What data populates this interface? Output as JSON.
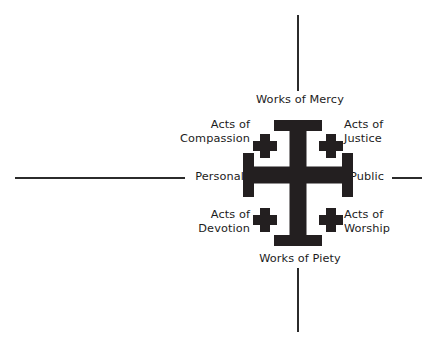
{
  "diagram": {
    "symbol": {
      "name": "jerusalem-cross",
      "color": "#231f20"
    },
    "axes": {
      "horizontal": {
        "left_label": "Personal",
        "right_label": "Public"
      },
      "vertical": {
        "top_label": "Works of Mercy",
        "bottom_label": "Works of Piety"
      },
      "line_color": "#2b2b2b"
    },
    "quadrants": [
      {
        "position": "top-left",
        "label": "Acts of\nCompassion",
        "line1": "Acts of",
        "line2": "Compassion"
      },
      {
        "position": "top-right",
        "label": "Acts of\nJustice",
        "line1": "Acts of",
        "line2": "Justice"
      },
      {
        "position": "bottom-left",
        "label": "Acts of\nDevotion",
        "line1": "Acts of",
        "line2": "Devotion"
      },
      {
        "position": "bottom-right",
        "label": "Acts of\nWorship",
        "line1": "Acts of",
        "line2": "Worship"
      }
    ]
  }
}
